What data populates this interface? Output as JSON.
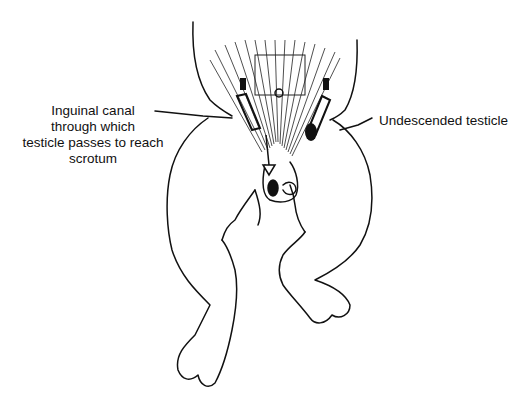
{
  "figure": {
    "labels": {
      "inguinal_canal_line1": "Inguinal canal",
      "inguinal_canal_line2": "through which",
      "inguinal_canal_line3": "testicle passes to reach",
      "inguinal_canal_line4": "scrotum",
      "undescended_testicle": "Undescended testicle"
    },
    "colors": {
      "ink": "#111111",
      "background": "#ffffff"
    }
  }
}
